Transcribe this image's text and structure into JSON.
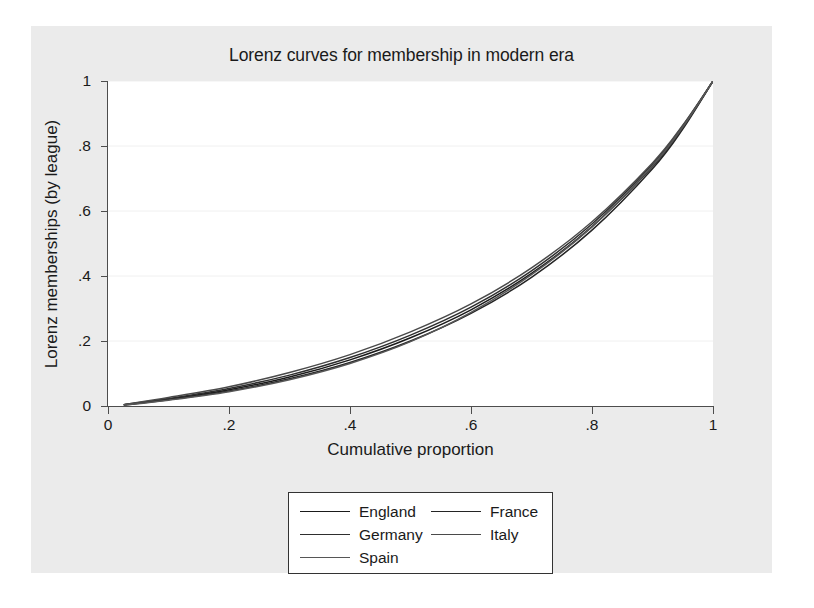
{
  "chart_data": {
    "type": "line",
    "title": "Lorenz curves for membership in modern era",
    "xlabel": "Cumulative proportion",
    "ylabel": "Lorenz memberships (by league)",
    "xlim": [
      0,
      1
    ],
    "ylim": [
      0,
      1
    ],
    "xticks": [
      "0",
      ".2",
      ".4",
      ".6",
      ".8",
      "1"
    ],
    "xtick_values": [
      0,
      0.2,
      0.4,
      0.6,
      0.8,
      1
    ],
    "yticks": [
      "0",
      ".2",
      ".4",
      ".6",
      ".8",
      "1"
    ],
    "ytick_values": [
      0,
      0.2,
      0.4,
      0.6,
      0.8,
      1
    ],
    "grid": "horizontal",
    "legend_position": "below-plot",
    "x": [
      0.027,
      0.1,
      0.2,
      0.3,
      0.4,
      0.5,
      0.6,
      0.7,
      0.8,
      0.9,
      0.95,
      1.0
    ],
    "series": [
      {
        "name": "England",
        "color": "#1a1a1a",
        "values": [
          0.004,
          0.021,
          0.05,
          0.089,
          0.142,
          0.21,
          0.296,
          0.408,
          0.552,
          0.737,
          0.857,
          1.0
        ]
      },
      {
        "name": "France",
        "color": "#242424",
        "values": [
          0.003,
          0.019,
          0.046,
          0.084,
          0.134,
          0.2,
          0.285,
          0.396,
          0.541,
          0.73,
          0.852,
          1.0
        ]
      },
      {
        "name": "Germany",
        "color": "#2e2e2e",
        "values": [
          0.004,
          0.023,
          0.054,
          0.095,
          0.149,
          0.218,
          0.304,
          0.416,
          0.56,
          0.744,
          0.862,
          1.0
        ]
      },
      {
        "name": "Italy",
        "color": "#4a4a4a",
        "values": [
          0.005,
          0.026,
          0.059,
          0.103,
          0.158,
          0.228,
          0.314,
          0.425,
          0.567,
          0.748,
          0.864,
          1.0
        ]
      },
      {
        "name": "Spain",
        "color": "#565656",
        "values": [
          0.003,
          0.018,
          0.044,
          0.081,
          0.131,
          0.198,
          0.288,
          0.404,
          0.551,
          0.739,
          0.858,
          1.0
        ]
      }
    ],
    "legend_rows": [
      [
        "England",
        "France"
      ],
      [
        "Germany",
        "Italy"
      ],
      [
        "Spain",
        null
      ]
    ]
  },
  "colors": {
    "figure_background": "#ebebeb",
    "plot_background": "#ffffff",
    "page_background": "#ffffff",
    "axis": "#4d4d4d",
    "grid": "#f0f0f0",
    "text": "#1a1a1a",
    "legend_border": "#333333"
  }
}
